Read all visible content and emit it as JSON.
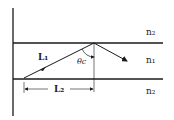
{
  "diagram": {
    "labels": {
      "n_top": "n₂",
      "n_mid": "n₁",
      "n_bot": "n₂",
      "L1": "L₁",
      "L2": "L₂",
      "theta": "θc"
    },
    "colors": {
      "line": "#1a1a1a",
      "background": "#ffffff"
    }
  }
}
